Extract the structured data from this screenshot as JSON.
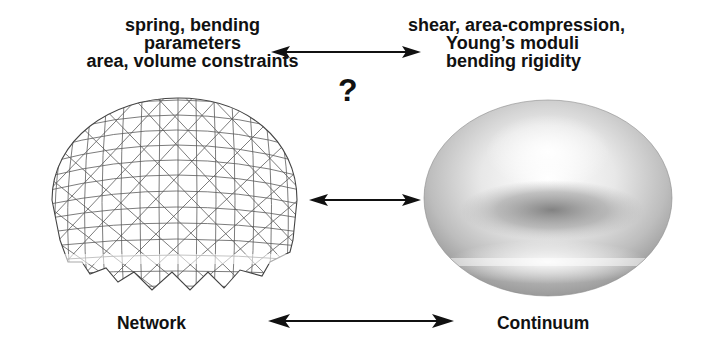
{
  "network_params": {
    "lines": [
      "spring, bending",
      "parameters",
      "area, volume constraints"
    ]
  },
  "continuum_params": {
    "lines": [
      "shear, area-compression,",
      "Young’s moduli",
      "bending rigidity"
    ]
  },
  "question_mark": "?",
  "labels": {
    "network": "Network",
    "continuum": "Continuum"
  },
  "colors": {
    "text": "#111111",
    "mesh_line": "#555555",
    "background": "#ffffff"
  },
  "arrows": [
    {
      "name": "parameter-mapping-arrow",
      "type": "bidirectional"
    },
    {
      "name": "model-mapping-arrow",
      "type": "bidirectional"
    },
    {
      "name": "network-continuum-arrow",
      "type": "bidirectional"
    }
  ]
}
